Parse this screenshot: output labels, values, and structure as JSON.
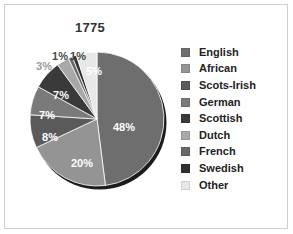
{
  "frame": {
    "border_color": "#cfcfcf",
    "background": "#ffffff"
  },
  "chart_data": {
    "type": "pie",
    "title": "1775",
    "xlabel": "",
    "ylabel": "",
    "legend_position": "right",
    "grid": false,
    "categories": [
      "English",
      "African",
      "Scots-Irish",
      "German",
      "Scottish",
      "Dutch",
      "French",
      "Swedish",
      "Other"
    ],
    "values": [
      48,
      20,
      8,
      7,
      7,
      3,
      1,
      1,
      5
    ],
    "value_labels": [
      "48%",
      "20%",
      "8%",
      "7%",
      "7%",
      "3%",
      "1%",
      "1%",
      "5%"
    ],
    "colors": [
      "#6e6e6e",
      "#949494",
      "#5a5a5a",
      "#7a7a7a",
      "#3a3a3a",
      "#a8a8a8",
      "#686868",
      "#303030",
      "#e8e8e8"
    ],
    "units": "percent",
    "total": 100
  },
  "labels": [
    {
      "text": "48%",
      "x": 124,
      "y": 127,
      "style": "inside"
    },
    {
      "text": "20%",
      "x": 82,
      "y": 163,
      "style": "inside"
    },
    {
      "text": "8%",
      "x": 50,
      "y": 137,
      "style": "inside"
    },
    {
      "text": "7%",
      "x": 47,
      "y": 115,
      "style": "inside"
    },
    {
      "text": "7%",
      "x": 61,
      "y": 95,
      "style": "inside"
    },
    {
      "text": "3%",
      "x": 44,
      "y": 66,
      "style": "outside light"
    },
    {
      "text": "1%",
      "x": 60,
      "y": 56,
      "style": "outside"
    },
    {
      "text": "1%",
      "x": 78,
      "y": 56,
      "style": "outside"
    },
    {
      "text": "5%",
      "x": 94,
      "y": 71,
      "style": "inside"
    }
  ],
  "legend": {
    "items": [
      {
        "label": "English",
        "color": "#6e6e6e"
      },
      {
        "label": "African",
        "color": "#949494"
      },
      {
        "label": "Scots-Irish",
        "color": "#5a5a5a"
      },
      {
        "label": "German",
        "color": "#7a7a7a"
      },
      {
        "label": "Scottish",
        "color": "#3a3a3a"
      },
      {
        "label": "Dutch",
        "color": "#a8a8a8"
      },
      {
        "label": "French",
        "color": "#686868"
      },
      {
        "label": "Swedish",
        "color": "#303030"
      },
      {
        "label": "Other",
        "color": "#e8e8e8"
      }
    ]
  }
}
